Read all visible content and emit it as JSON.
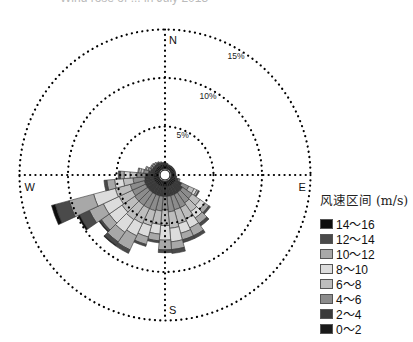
{
  "title": "Wind rose of ... in July 2013",
  "chart_data": {
    "type": "windrose",
    "title": "",
    "center": [
      165,
      175
    ],
    "px_per_percent": 9.7,
    "rings": [
      {
        "value": 5,
        "label": "5%"
      },
      {
        "value": 10,
        "label": "10%"
      },
      {
        "value": 15,
        "label": "15%"
      }
    ],
    "directions": {
      "N": "N",
      "E": "E",
      "S": "S",
      "W": "W"
    },
    "legend_title": "风速区间 (m/s)",
    "bins": [
      {
        "label": "14～16",
        "color": "#0d0d0d"
      },
      {
        "label": "12～14",
        "color": "#4a4a4a"
      },
      {
        "label": "10～12",
        "color": "#a8a8a8"
      },
      {
        "label": "8～10",
        "color": "#dcdcdc"
      },
      {
        "label": "6～8",
        "color": "#bdbdbd"
      },
      {
        "label": "4～6",
        "color": "#8c8c8c"
      },
      {
        "label": "2～4",
        "color": "#3a3a3a"
      },
      {
        "label": "0～2",
        "color": "#1a1a1a"
      }
    ],
    "sector_width_deg": 10,
    "stack_order_inner_to_outer": [
      "0～2",
      "2～4",
      "4～6",
      "6～8",
      "8～10",
      "10～12",
      "12～14",
      "14～16"
    ],
    "sectors": [
      {
        "dir": 0,
        "values": [
          0.5,
          0.2,
          0,
          0,
          0,
          0,
          0,
          0
        ]
      },
      {
        "dir": 10,
        "values": [
          0.5,
          0.1,
          0,
          0,
          0,
          0,
          0,
          0
        ]
      },
      {
        "dir": 20,
        "values": [
          0.4,
          0.1,
          0,
          0,
          0,
          0,
          0,
          0
        ]
      },
      {
        "dir": 30,
        "values": [
          0.4,
          0.1,
          0,
          0,
          0,
          0,
          0,
          0
        ]
      },
      {
        "dir": 40,
        "values": [
          0.4,
          0.1,
          0,
          0,
          0,
          0,
          0,
          0
        ]
      },
      {
        "dir": 50,
        "values": [
          0.4,
          0.1,
          0,
          0,
          0,
          0,
          0,
          0
        ]
      },
      {
        "dir": 60,
        "values": [
          0.4,
          0.1,
          0,
          0,
          0,
          0,
          0,
          0
        ]
      },
      {
        "dir": 70,
        "values": [
          0.4,
          0.1,
          0,
          0,
          0,
          0,
          0,
          0
        ]
      },
      {
        "dir": 80,
        "values": [
          0.4,
          0.1,
          0,
          0,
          0,
          0,
          0,
          0
        ]
      },
      {
        "dir": 90,
        "values": [
          0.4,
          0.1,
          0,
          0,
          0,
          0,
          0,
          0
        ]
      },
      {
        "dir": 100,
        "values": [
          0.4,
          0.2,
          0,
          0,
          0,
          0,
          0,
          0
        ]
      },
      {
        "dir": 110,
        "values": [
          0.5,
          0.3,
          0.2,
          0,
          0,
          0,
          0,
          0
        ]
      },
      {
        "dir": 120,
        "values": [
          0.6,
          0.7,
          0.8,
          0.6,
          0.3,
          0.2,
          0.1,
          0
        ]
      },
      {
        "dir": 130,
        "values": [
          0.6,
          1.0,
          1.2,
          1.0,
          0.6,
          0.5,
          0.2,
          0
        ]
      },
      {
        "dir": 140,
        "values": [
          0.6,
          1.0,
          1.3,
          1.1,
          0.8,
          0.7,
          0.3,
          0
        ]
      },
      {
        "dir": 150,
        "values": [
          0.6,
          1.0,
          1.5,
          1.3,
          1.0,
          0.9,
          0.3,
          0
        ]
      },
      {
        "dir": 160,
        "values": [
          0.6,
          1.0,
          1.5,
          1.5,
          1.0,
          0.7,
          0.3,
          0
        ]
      },
      {
        "dir": 170,
        "values": [
          0.6,
          1.0,
          1.6,
          1.7,
          1.4,
          0.8,
          0.4,
          0
        ]
      },
      {
        "dir": 180,
        "values": [
          0.6,
          1.0,
          1.4,
          1.6,
          1.5,
          1.0,
          0.3,
          0
        ]
      },
      {
        "dir": 190,
        "values": [
          0.6,
          1.0,
          1.5,
          1.4,
          1.0,
          0.7,
          0.2,
          0
        ]
      },
      {
        "dir": 200,
        "values": [
          0.6,
          1.0,
          1.6,
          1.6,
          1.2,
          0.8,
          0.2,
          0
        ]
      },
      {
        "dir": 210,
        "values": [
          0.6,
          1.0,
          1.6,
          1.7,
          1.4,
          1.6,
          0.4,
          0
        ]
      },
      {
        "dir": 220,
        "values": [
          0.6,
          1.0,
          1.6,
          1.8,
          1.6,
          1.2,
          0.4,
          0.1
        ]
      },
      {
        "dir": 230,
        "values": [
          0.6,
          1.0,
          1.6,
          1.6,
          1.6,
          1.0,
          0.2,
          0.1
        ]
      },
      {
        "dir": 240,
        "values": [
          0.6,
          1.0,
          1.5,
          1.5,
          1.8,
          1.6,
          1.1,
          0.2
        ]
      },
      {
        "dir": 250,
        "values": [
          0.6,
          1.0,
          1.5,
          1.6,
          2.3,
          2.6,
          1.5,
          0.4
        ]
      },
      {
        "dir": 260,
        "values": [
          0.6,
          0.9,
          1.2,
          1.0,
          0.9,
          0.8,
          0.3,
          0
        ]
      },
      {
        "dir": 270,
        "values": [
          0.6,
          0.8,
          0.9,
          0.7,
          0.6,
          0.4,
          0.2,
          0
        ]
      },
      {
        "dir": 280,
        "values": [
          0.5,
          0.6,
          0.5,
          0.3,
          0.2,
          0.1,
          0,
          0
        ]
      },
      {
        "dir": 290,
        "values": [
          0.5,
          0.4,
          0.3,
          0.2,
          0.1,
          0,
          0,
          0
        ]
      },
      {
        "dir": 300,
        "values": [
          0.5,
          0.3,
          0.2,
          0.1,
          0,
          0,
          0,
          0
        ]
      },
      {
        "dir": 310,
        "values": [
          0.5,
          0.3,
          0.2,
          0.1,
          0,
          0,
          0,
          0
        ]
      },
      {
        "dir": 320,
        "values": [
          0.5,
          0.3,
          0.2,
          0,
          0,
          0,
          0,
          0
        ]
      },
      {
        "dir": 330,
        "values": [
          0.5,
          0.3,
          0.1,
          0,
          0,
          0,
          0,
          0
        ]
      },
      {
        "dir": 340,
        "values": [
          0.5,
          0.2,
          0.1,
          0,
          0,
          0,
          0,
          0
        ]
      },
      {
        "dir": 350,
        "values": [
          0.5,
          0.2,
          0,
          0,
          0,
          0,
          0,
          0
        ]
      }
    ],
    "legend_position": "right",
    "grid": true
  }
}
